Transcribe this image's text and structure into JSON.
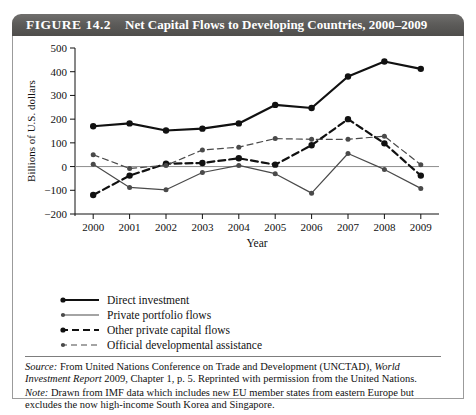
{
  "figure": {
    "label": "FIGURE 14.2",
    "title": "Net Capital Flows to Developing Countries, 2000–2009"
  },
  "source_note": {
    "source_prefix": "Source:",
    "source_text_1": " From United Nations Conference on Trade and Development (UNCTAD), ",
    "source_italic_1": "World Investment Report",
    "source_text_2": " 2009, Chapter 1, p. 5. Reprinted with permission from the United Nations.",
    "note_prefix": "Note:",
    "note_text": " Drawn from IMF data which includes new EU member states from eastern Europe but excludes the now high-income South Korea and Singapore."
  },
  "chart_data": {
    "type": "line",
    "title": "Net Capital Flows to Developing Countries, 2000–2009",
    "xlabel": "Year",
    "ylabel": "Billions of U.S. dollars",
    "categories": [
      2000,
      2001,
      2002,
      2003,
      2004,
      2005,
      2006,
      2007,
      2008,
      2009
    ],
    "xtick_labels": [
      "2000",
      "2001",
      "2002",
      "2003",
      "2004",
      "2005",
      "2006",
      "2007",
      "2008",
      "2009"
    ],
    "ytick_labels": [
      "500",
      "400",
      "300",
      "200",
      "100",
      "0",
      "−100",
      "−200"
    ],
    "ylim": [
      -200,
      500
    ],
    "ytick_values": [
      500,
      400,
      300,
      200,
      100,
      0,
      -100,
      -200
    ],
    "grid": false,
    "zero_line": true,
    "legend_position": "below-left",
    "series": [
      {
        "name": "Direct investment",
        "style": "solid",
        "width": "thick",
        "color": "#111111",
        "marker": "filled-circle",
        "values": [
          170,
          182,
          152,
          160,
          182,
          260,
          247,
          380,
          443,
          412
        ]
      },
      {
        "name": "Private portfolio flows",
        "style": "solid",
        "width": "thin",
        "color": "#4a4a4a",
        "marker": "filled-circle",
        "values": [
          10,
          -88,
          -98,
          -25,
          5,
          -30,
          -112,
          55,
          -12,
          -92
        ]
      },
      {
        "name": "Other private capital flows",
        "style": "dashed",
        "width": "thick",
        "color": "#111111",
        "marker": "filled-circle",
        "values": [
          -120,
          -38,
          12,
          15,
          35,
          8,
          90,
          200,
          98,
          -38
        ]
      },
      {
        "name": "Official developmental assistance",
        "style": "dashed",
        "width": "thin",
        "color": "#4a4a4a",
        "marker": "filled-circle",
        "values": [
          50,
          -8,
          5,
          70,
          82,
          118,
          115,
          115,
          128,
          8
        ]
      }
    ]
  }
}
